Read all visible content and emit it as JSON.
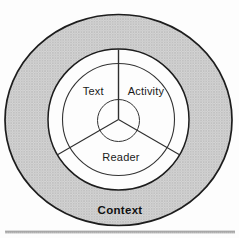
{
  "diagram": {
    "kind": "concentric-ring-model",
    "sectors": [
      {
        "label": "Text"
      },
      {
        "label": "Activity"
      },
      {
        "label": "Reader"
      }
    ],
    "outer_ring_label": "Context"
  },
  "colors": {
    "page_bg": "#fdfdfd",
    "stipple_base": "#d6d6d6",
    "stipple_dot": "#a8a8a8",
    "stipple_dot_light": "#c2c2c2",
    "outer_outline": "#1d1d1d",
    "inner_outline": "#333333",
    "divider": "#2e2e2e",
    "label": "#1a1a1a",
    "context_label": "#111111",
    "rule_dark": "#8f8f8f",
    "rule_light": "#bdbdbd"
  }
}
